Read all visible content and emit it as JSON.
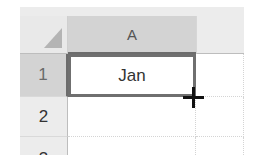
{
  "spreadsheet": {
    "select_all_icon": "select-all-triangle",
    "columns": [
      {
        "label": "A",
        "selected": true
      },
      {
        "label": "",
        "selected": false
      }
    ],
    "rows": [
      {
        "label": "1",
        "selected": true
      },
      {
        "label": "2",
        "selected": false
      },
      {
        "label": "3",
        "selected": false
      }
    ],
    "cells": {
      "A1": "Jan",
      "B1": "",
      "A2": "",
      "B2": "",
      "A3": "",
      "B3": ""
    },
    "active_cell": "A1",
    "cursor_icon": "crosshair-fill-handle-cursor",
    "colors": {
      "selection_border": "#6f6f6f",
      "selected_header": "#d3d3d3",
      "header": "#ececec"
    }
  }
}
